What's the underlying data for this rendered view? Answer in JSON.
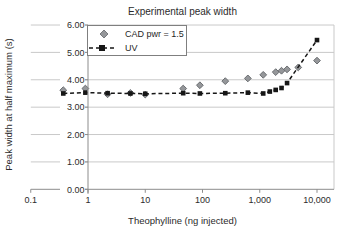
{
  "chart_data": {
    "type": "scatter",
    "title": "Experimental peak width",
    "xlabel": "Theophylline (ng injected)",
    "ylabel": "Peak width at half maximum (s)",
    "x_scale": "log",
    "xlim": [
      0.1,
      18000
    ],
    "ylim": [
      0,
      6
    ],
    "grid": "horizontal-major",
    "legend_position": "top-left-inside",
    "x_ticks": [
      {
        "v": 0.1,
        "label": "0.1"
      },
      {
        "v": 1,
        "label": "1"
      },
      {
        "v": 10,
        "label": "10"
      },
      {
        "v": 100,
        "label": "100"
      },
      {
        "v": 1000,
        "label": "1,000"
      },
      {
        "v": 10000,
        "label": "10,000"
      }
    ],
    "y_ticks": [
      {
        "v": 0,
        "label": "0.00"
      },
      {
        "v": 1,
        "label": "1.00"
      },
      {
        "v": 2,
        "label": "2.00"
      },
      {
        "v": 3,
        "label": "3.00"
      },
      {
        "v": 4,
        "label": "4.00"
      },
      {
        "v": 5,
        "label": "5.00"
      },
      {
        "v": 6,
        "label": "6.00"
      }
    ],
    "series": [
      {
        "name": "CAD pwr = 1.5",
        "marker": "diamond",
        "line": "none",
        "fill": "#95979a",
        "stroke": "#626569",
        "points": [
          [
            0.37,
            3.62
          ],
          [
            0.9,
            3.68
          ],
          [
            2.2,
            3.47
          ],
          [
            5.5,
            3.52
          ],
          [
            10,
            3.46
          ],
          [
            46,
            3.68
          ],
          [
            90,
            3.8
          ],
          [
            250,
            3.95
          ],
          [
            620,
            4.05
          ],
          [
            1150,
            4.18
          ],
          [
            1900,
            4.28
          ],
          [
            2400,
            4.33
          ],
          [
            3000,
            4.38
          ],
          [
            4700,
            4.45
          ],
          [
            10000,
            4.7
          ]
        ]
      },
      {
        "name": "UV",
        "marker": "square",
        "line": "dashed",
        "fill": "#161616",
        "stroke": "#161616",
        "points": [
          [
            0.37,
            3.5
          ],
          [
            0.9,
            3.53
          ],
          [
            2.2,
            3.51
          ],
          [
            5.5,
            3.5
          ],
          [
            10,
            3.49
          ],
          [
            46,
            3.51
          ],
          [
            90,
            3.5
          ],
          [
            250,
            3.51
          ],
          [
            620,
            3.53
          ],
          [
            1150,
            3.5
          ],
          [
            1500,
            3.57
          ],
          [
            1900,
            3.63
          ],
          [
            2400,
            3.7
          ],
          [
            3000,
            3.88
          ],
          [
            10000,
            5.45
          ]
        ]
      }
    ]
  },
  "colors": {
    "background": "#ffffff",
    "gridline": "#c9c9c9",
    "axis": "#8c8c8c",
    "tick_text": "#2b2b2b",
    "legend_border": "#7f7f7f"
  }
}
